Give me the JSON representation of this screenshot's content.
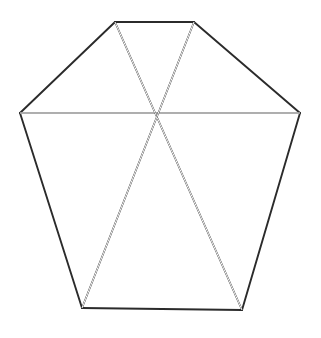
{
  "figure": {
    "canvas": {
      "width": 321,
      "height": 338,
      "background": "#ffffff"
    },
    "style": {
      "line_color": "#2b2b2b",
      "hull_stroke_width": 1.9,
      "chord_rail_stroke_width": 1.6,
      "chord_gap_color": "#ffffff",
      "chord_gap_width": 1.0,
      "chord_rail_offset": 1.6
    },
    "vertices": [
      {
        "name": "top-left",
        "label": "A",
        "x": 115,
        "y": 22
      },
      {
        "name": "top-right",
        "label": "B",
        "x": 194,
        "y": 22
      },
      {
        "name": "right",
        "label": "C",
        "x": 300,
        "y": 113
      },
      {
        "name": "bottom-right",
        "label": "D",
        "x": 242,
        "y": 310
      },
      {
        "name": "bottom-left",
        "label": "E",
        "x": 82,
        "y": 308
      },
      {
        "name": "left",
        "label": "F",
        "x": 20,
        "y": 113
      }
    ],
    "center": {
      "name": "crossing-point",
      "label": "O",
      "x": 158,
      "y": 115
    },
    "hull_edges": [
      {
        "name": "edge-top",
        "from": "top-left",
        "to": "top-right",
        "x1": 115,
        "y1": 22,
        "x2": 194,
        "y2": 22
      },
      {
        "name": "edge-upper-right",
        "from": "top-right",
        "to": "right",
        "x1": 194,
        "y1": 22,
        "x2": 300,
        "y2": 113
      },
      {
        "name": "edge-lower-right",
        "from": "right",
        "to": "bottom-right",
        "x1": 300,
        "y1": 113,
        "x2": 242,
        "y2": 310
      },
      {
        "name": "edge-bottom",
        "from": "bottom-right",
        "to": "bottom-left",
        "x1": 242,
        "y1": 310,
        "x2": 82,
        "y2": 308
      },
      {
        "name": "edge-lower-left",
        "from": "bottom-left",
        "to": "left",
        "x1": 82,
        "y1": 308,
        "x2": 20,
        "y2": 113
      },
      {
        "name": "edge-upper-left",
        "from": "left",
        "to": "top-left",
        "x1": 20,
        "y1": 113,
        "x2": 115,
        "y2": 22
      }
    ],
    "chords": [
      {
        "name": "chord-horizontal",
        "from": "left",
        "to": "right",
        "x1": 20,
        "y1": 113,
        "x2": 300,
        "y2": 113,
        "double_ruled": true
      },
      {
        "name": "chord-topleft-botright",
        "from": "top-left",
        "to": "bottom-right",
        "x1": 115,
        "y1": 22,
        "x2": 242,
        "y2": 310,
        "double_ruled": true
      },
      {
        "name": "chord-topright-botleft",
        "from": "top-right",
        "to": "bottom-left",
        "x1": 194,
        "y1": 22,
        "x2": 82,
        "y2": 308,
        "double_ruled": true
      }
    ]
  }
}
